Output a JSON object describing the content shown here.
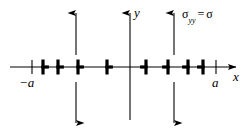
{
  "figure": {
    "background_color": "#ffffff",
    "ink_color": "#000000",
    "width": 249,
    "height": 133
  },
  "axes": {
    "x_axis": {
      "label": "x",
      "y_pixel": 67,
      "x_start": 10,
      "x_end": 238,
      "arrow": "right"
    },
    "y_axis": {
      "label": "y",
      "x_pixel": 130,
      "y_start": 120,
      "y_end": 12,
      "arrow": "up"
    },
    "ticks": [
      {
        "label": "−a",
        "x_pixel": 32,
        "name": "tick-minus-a"
      },
      {
        "label": "a",
        "x_pixel": 216,
        "name": "tick-a"
      }
    ]
  },
  "stress": {
    "symbol": "σ",
    "subscript": "yy",
    "equals": "=",
    "value": "σ",
    "full_label": "σyy = σ",
    "arrow_up_positions": [
      76,
      174
    ],
    "arrow_down_positions": [
      76,
      174
    ],
    "arrow_top_y": 10,
    "arrow_bottom_y": 124
  },
  "dislocations": {
    "note": "Edge dislocation symbols along x-axis; left group flags point right (positive), right group flags point left (negative)",
    "count_left": 4,
    "count_right": 4,
    "total": 8,
    "left_group": [
      {
        "x": 43,
        "orientation": "right"
      },
      {
        "x": 58,
        "orientation": "right"
      },
      {
        "x": 78,
        "orientation": "right"
      },
      {
        "x": 107,
        "orientation": "right"
      }
    ],
    "right_group": [
      {
        "x": 146,
        "orientation": "left"
      },
      {
        "x": 168,
        "orientation": "left"
      },
      {
        "x": 188,
        "orientation": "left"
      },
      {
        "x": 203,
        "orientation": "left"
      }
    ]
  }
}
